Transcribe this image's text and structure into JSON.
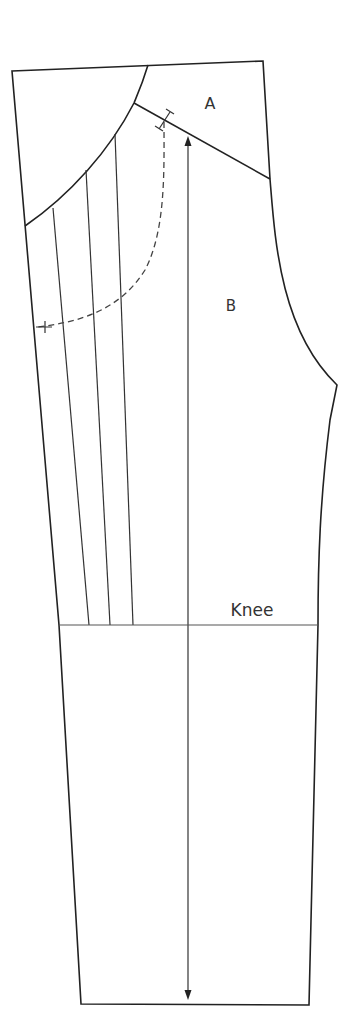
{
  "diagram": {
    "type": "trouser-pattern",
    "labels": {
      "region_a": "A",
      "region_b": "B",
      "knee": "Knee"
    },
    "colors": {
      "line": "#222222",
      "background": "#ffffff"
    },
    "elements": [
      "outline",
      "yoke-seam-A",
      "side-arc",
      "slash-lines",
      "dashed-pocket-curve",
      "grainline-arrow",
      "knee-line"
    ]
  }
}
